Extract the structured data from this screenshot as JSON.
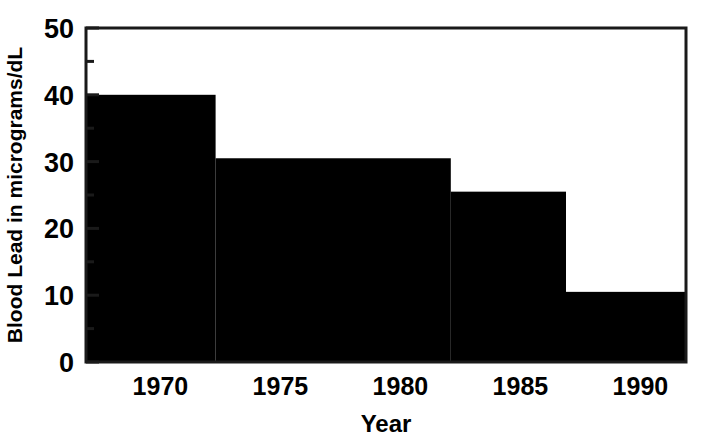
{
  "chart_data": {
    "type": "bar",
    "title": "",
    "subtitle": "",
    "xlabel": "Year",
    "ylabel": "Blood Lead in micrograms/dL",
    "xlim": [
      1966.9,
      1991.9
    ],
    "ylim": [
      0,
      50
    ],
    "grid": false,
    "legend": null,
    "style": "step / staircase bars, solid black fill",
    "x_ticks": [
      {
        "value": 1970,
        "label": "1970"
      },
      {
        "value": 1975,
        "label": "1975"
      },
      {
        "value": 1980,
        "label": "1980"
      },
      {
        "value": 1985,
        "label": "1985"
      },
      {
        "value": 1990,
        "label": "1990"
      }
    ],
    "y_ticks": [
      {
        "value": 0,
        "label": "0"
      },
      {
        "value": 10,
        "label": "10"
      },
      {
        "value": 20,
        "label": "20"
      },
      {
        "value": 30,
        "label": "30"
      },
      {
        "value": 40,
        "label": "40"
      },
      {
        "value": 50,
        "label": "50"
      }
    ],
    "y_minor_ticks": [
      5,
      15,
      25,
      35,
      45
    ],
    "categories": [
      "1966.9-1972.3",
      "1972.3-1982.1",
      "1982.1-1986.9",
      "1986.9-1991.9"
    ],
    "values": [
      40,
      30.5,
      25.5,
      10.5
    ],
    "bars": [
      {
        "x_start": 1966.9,
        "x_end": 1972.3,
        "value": 40
      },
      {
        "x_start": 1972.3,
        "x_end": 1982.1,
        "value": 30.5
      },
      {
        "x_start": 1982.1,
        "x_end": 1986.9,
        "value": 25.5
      },
      {
        "x_start": 1986.9,
        "x_end": 1991.9,
        "value": 10.5
      }
    ],
    "colors": {
      "bar_fill": "#000000",
      "axis": "#1a1a1a",
      "text": "#000000",
      "background": "#ffffff"
    }
  }
}
